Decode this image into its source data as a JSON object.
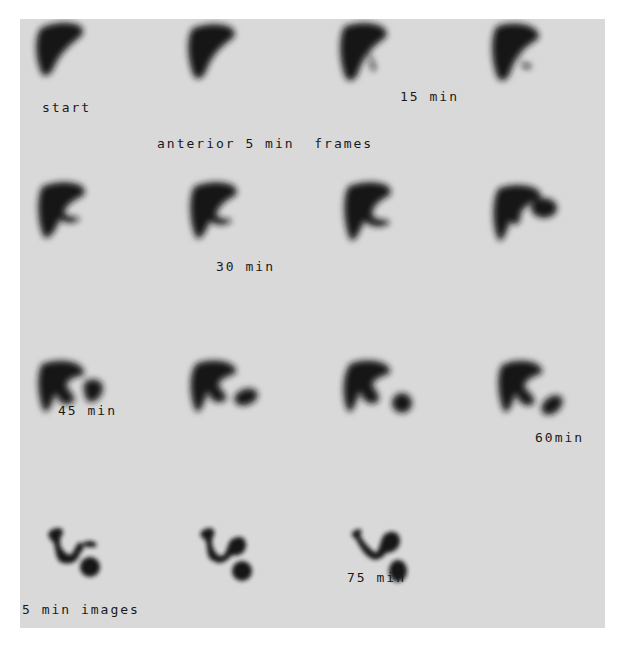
{
  "figure": {
    "background_color": "#d9d9d9",
    "ink_color": "#141414",
    "labels": {
      "start": "start",
      "title": "anterior 5 min  frames",
      "t15": "15 min",
      "t30": "30 min",
      "t45": "45 min",
      "t60": "60min",
      "t75": "75 min",
      "footer": "5 min images"
    },
    "rows": [
      {
        "row": 1,
        "frames": 4,
        "description": "liver only"
      },
      {
        "row": 2,
        "frames": 4,
        "description": "liver with duct/bowel activity emerging"
      },
      {
        "row": 3,
        "frames": 4,
        "description": "liver with bowel activity"
      },
      {
        "row": 4,
        "frames": 3,
        "description": "bowel activity predominant"
      }
    ]
  }
}
